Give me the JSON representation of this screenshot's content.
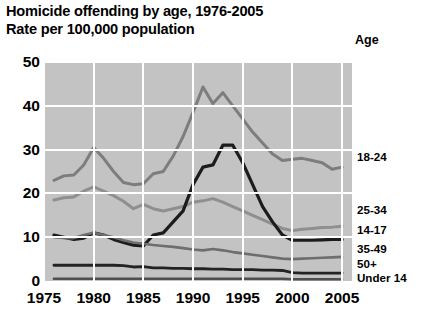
{
  "header": {
    "title": "Homicide offending by age, 1976-2005",
    "subtitle": "Rate per 100,000 population",
    "legend_header": "Age"
  },
  "chart_data": {
    "type": "line",
    "title": "Homicide offending by age, 1976-2005",
    "subtitle": "Rate per 100,000 population",
    "xlabel": "",
    "ylabel": "Rate per 100,000 population",
    "xlim": [
      1975,
      2006
    ],
    "ylim": [
      0,
      50
    ],
    "yticks": [
      0,
      10,
      20,
      30,
      40,
      50
    ],
    "xticks": [
      1975,
      1980,
      1985,
      1990,
      1995,
      2000,
      2005
    ],
    "grid": true,
    "legend_position": "right-of-plot-end-labels",
    "plot_background": "#c3c3c3",
    "gridline_color": "#ffffff",
    "x": [
      1976,
      1977,
      1978,
      1979,
      1980,
      1981,
      1982,
      1983,
      1984,
      1985,
      1986,
      1987,
      1988,
      1989,
      1990,
      1991,
      1992,
      1993,
      1994,
      1995,
      1996,
      1997,
      1998,
      1999,
      2000,
      2001,
      2002,
      2003,
      2004,
      2005
    ],
    "series": [
      {
        "name": "18-24",
        "color": "#7d7d7d",
        "width": 3.0,
        "values": [
          23.0,
          24.0,
          24.2,
          26.5,
          30.5,
          28.0,
          25.0,
          22.5,
          22.0,
          22.2,
          24.5,
          25.0,
          28.5,
          33.0,
          38.5,
          44.3,
          40.5,
          43.0,
          40.0,
          37.0,
          34.0,
          31.5,
          29.0,
          27.5,
          27.8,
          28.0,
          27.5,
          27.0,
          25.5,
          26.0
        ]
      },
      {
        "name": "25-34",
        "color": "#8f8f8f",
        "width": 3.0,
        "values": [
          18.5,
          19.0,
          19.2,
          20.5,
          21.5,
          20.5,
          19.5,
          18.2,
          16.5,
          17.5,
          16.5,
          16.0,
          16.5,
          17.0,
          18.0,
          18.3,
          18.8,
          18.0,
          17.0,
          16.0,
          15.0,
          14.0,
          13.0,
          12.0,
          11.5,
          11.8,
          12.0,
          12.2,
          12.3,
          12.5
        ]
      },
      {
        "name": "14-17",
        "color": "#1c1c1c",
        "width": 3.2,
        "values": [
          10.5,
          10.0,
          9.5,
          9.8,
          11.0,
          10.5,
          9.5,
          8.8,
          8.2,
          8.0,
          10.5,
          11.0,
          13.5,
          16.0,
          22.0,
          26.0,
          26.5,
          31.0,
          31.0,
          27.0,
          22.0,
          17.0,
          13.5,
          10.5,
          9.3,
          9.3,
          9.3,
          9.4,
          9.5,
          9.5
        ]
      },
      {
        "name": "35-49",
        "color": "#6e6e6e",
        "width": 2.6,
        "values": [
          10.0,
          9.8,
          9.8,
          10.5,
          11.0,
          10.5,
          10.0,
          9.3,
          8.8,
          8.5,
          8.2,
          8.0,
          7.8,
          7.5,
          7.2,
          7.0,
          7.3,
          7.0,
          6.6,
          6.3,
          6.0,
          5.7,
          5.4,
          5.1,
          5.0,
          5.1,
          5.2,
          5.3,
          5.4,
          5.5
        ]
      },
      {
        "name": "50+",
        "color": "#232323",
        "width": 2.8,
        "values": [
          3.6,
          3.6,
          3.6,
          3.6,
          3.6,
          3.6,
          3.6,
          3.5,
          3.2,
          3.3,
          3.0,
          3.0,
          2.9,
          2.9,
          2.8,
          2.8,
          2.7,
          2.7,
          2.6,
          2.6,
          2.6,
          2.5,
          2.5,
          2.4,
          1.9,
          1.8,
          1.8,
          1.8,
          1.8,
          1.8
        ]
      },
      {
        "name": "Under 14",
        "color": "#4f4f4f",
        "width": 2.6,
        "values": [
          0.5,
          0.5,
          0.5,
          0.5,
          0.5,
          0.5,
          0.5,
          0.5,
          0.5,
          0.5,
          0.5,
          0.5,
          0.5,
          0.5,
          0.5,
          0.5,
          0.5,
          0.5,
          0.5,
          0.5,
          0.5,
          0.5,
          0.5,
          0.5,
          0.4,
          0.4,
          0.4,
          0.4,
          0.4,
          0.4
        ]
      }
    ]
  },
  "series_labels": [
    {
      "text": "18-24",
      "top": 151
    },
    {
      "text": "25-34",
      "top": 204
    },
    {
      "text": "14-17",
      "top": 224
    },
    {
      "text": "35-49",
      "top": 243
    },
    {
      "text": "50+",
      "top": 258
    },
    {
      "text": "Under 14",
      "top": 272
    }
  ]
}
